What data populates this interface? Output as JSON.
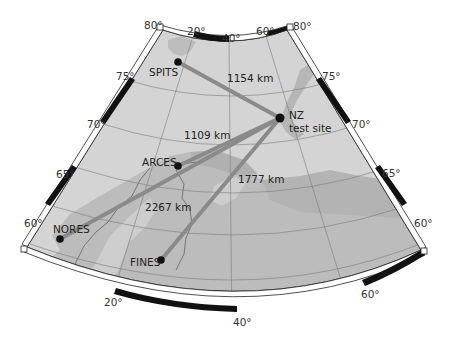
{
  "map": {
    "projection": "conic (polar stereographic sector)",
    "region": "Barents Sea / Fennoscandia / Novaya Zemlya",
    "colors": {
      "ocean": "#d6d6d6",
      "land": "#b4b4b4",
      "land_light": "#c7c7c7",
      "ray": "#8a8a8a",
      "grid": "#7a7a7a",
      "station": "#111111"
    },
    "lat_ticks_left": [
      {
        "label": "80°"
      },
      {
        "label": "75°"
      },
      {
        "label": "70°"
      },
      {
        "label": "65°"
      },
      {
        "label": "60°"
      }
    ],
    "lat_ticks_right": [
      {
        "label": "80°"
      },
      {
        "label": "75°"
      },
      {
        "label": "70°"
      },
      {
        "label": "65°"
      },
      {
        "label": "60°"
      }
    ],
    "lon_ticks_top": [
      {
        "label": "20°"
      },
      {
        "label": "40°"
      },
      {
        "label": "60°"
      }
    ],
    "lon_ticks_bottom": [
      {
        "label": "20°"
      },
      {
        "label": "40°"
      },
      {
        "label": "60°"
      }
    ],
    "source": {
      "name": "NZ",
      "label_line1": "NZ",
      "label_line2": "test site"
    },
    "stations": [
      {
        "name": "SPITS",
        "label": "SPITS",
        "distance": "1154 km"
      },
      {
        "name": "ARCES",
        "label": "ARCES",
        "distance": "1109 km"
      },
      {
        "name": "NORES",
        "label": "NORES",
        "distance": "2267 km"
      },
      {
        "name": "FINES",
        "label": "FINES",
        "distance": "1777 km"
      }
    ]
  }
}
